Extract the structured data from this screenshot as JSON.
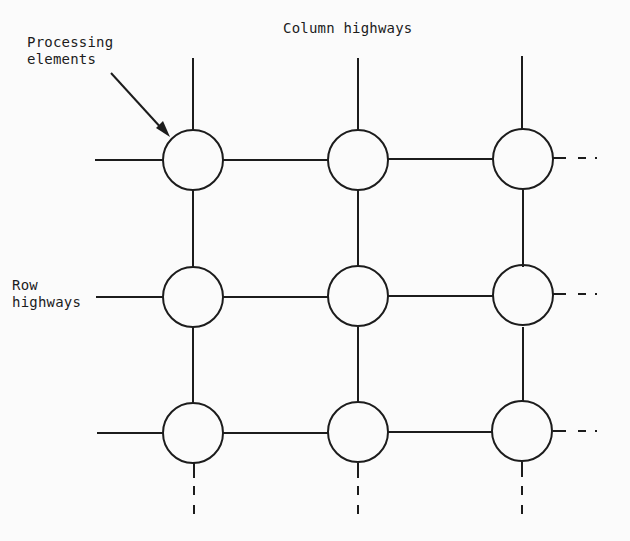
{
  "labels": {
    "column_highways": "Column highways",
    "processing_elements_line1": "Processing",
    "processing_elements_line2": "elements",
    "row_highways_line1": "Row",
    "row_highways_line2": "highways"
  },
  "grid": {
    "columns": [
      193,
      358,
      523
    ],
    "rows": [
      160,
      297,
      433
    ],
    "radius": 30,
    "stroke_color": "#1c1c1c"
  }
}
